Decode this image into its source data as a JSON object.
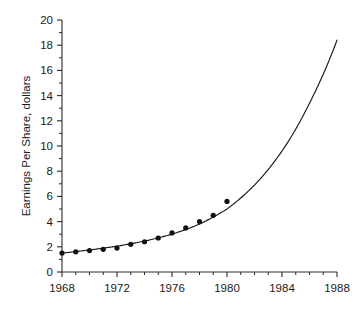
{
  "chart_data": {
    "type": "scatter",
    "title": "",
    "subtitle": "",
    "xlabel": "",
    "ylabel": "Earnings Per Share, dollars",
    "xlim": [
      1968,
      1988
    ],
    "ylim": [
      0,
      20
    ],
    "grid": false,
    "legend": null,
    "x_ticks_major": [
      1968,
      1972,
      1976,
      1980,
      1984,
      1988
    ],
    "x_tick_labels": [
      "1968",
      "1972",
      "1976",
      "1980",
      "1984",
      "1988"
    ],
    "x_ticks_minor_step": 1,
    "y_ticks_major": [
      0,
      2,
      4,
      6,
      8,
      10,
      12,
      14,
      16,
      18,
      20
    ],
    "y_tick_labels": [
      "0",
      "2",
      "4",
      "6",
      "8",
      "10",
      "12",
      "14",
      "16",
      "18",
      "20"
    ],
    "y_ticks_minor_step": 1,
    "series": [
      {
        "name": "Observed earnings per share",
        "type": "scatter",
        "marker": "filled-circle",
        "color": "#111111",
        "x": [
          1968,
          1969,
          1970,
          1971,
          1972,
          1973,
          1974,
          1975,
          1976,
          1977,
          1978
        ],
        "values": [
          1.5,
          1.6,
          1.7,
          1.8,
          1.9,
          2.2,
          2.4,
          2.7,
          3.1,
          3.5,
          4.0
        ],
        "points": [
          {
            "x": 1968,
            "y": 1.5
          },
          {
            "x": 1969,
            "y": 1.6
          },
          {
            "x": 1970,
            "y": 1.7
          },
          {
            "x": 1971,
            "y": 1.8
          },
          {
            "x": 1972,
            "y": 1.9
          },
          {
            "x": 1973,
            "y": 2.2
          },
          {
            "x": 1974,
            "y": 2.4
          },
          {
            "x": 1975,
            "y": 2.7
          },
          {
            "x": 1976,
            "y": 3.1
          },
          {
            "x": 1977,
            "y": 3.5
          },
          {
            "x": 1978,
            "y": 4.0
          },
          {
            "x": 1979,
            "y": 4.5
          },
          {
            "x": 1980,
            "y": 5.6
          }
        ]
      },
      {
        "name": "Exponential fit",
        "type": "line",
        "color": "#1a1a1a",
        "x": [
          1968,
          1970,
          1972,
          1974,
          1976,
          1978,
          1980,
          1982,
          1984,
          1986,
          1988
        ],
        "values": [
          1.5,
          1.75,
          2.05,
          2.45,
          3.0,
          3.8,
          5.0,
          6.9,
          9.6,
          13.4,
          18.4
        ]
      }
    ]
  },
  "axis_titles": {
    "y": "Earnings Per Share, dollars"
  }
}
